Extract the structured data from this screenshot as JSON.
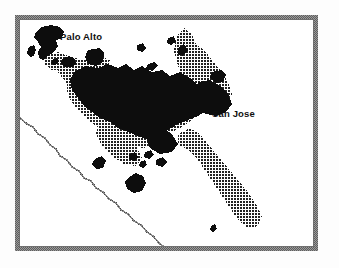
{
  "figure": {
    "kind": "thematic-map",
    "region": "Santa Clara Valley / South San Francisco Bay",
    "width": 339,
    "height": 268
  },
  "colors": {
    "page_background": "#ffffff",
    "map_background": "#fdfdfd",
    "frame": "#8c8c8c",
    "frame_inner_line": "#707070",
    "urban_core": "#0d0d0d",
    "urban_fringe": "#555555",
    "halftone_dot": "#1a1a1a",
    "boundary_line": "#6e6e6e",
    "label_text": "#101010"
  },
  "labels": {
    "palo_alto": "Palo Alto",
    "san_jose": "San Jose"
  },
  "legend_hint": {
    "dark_fill_meaning": "dense urbanized area",
    "dotted_fill_meaning": "urbanized area"
  },
  "features": {
    "frame": {
      "x": 17,
      "y": 17,
      "width": 299,
      "height": 232,
      "stroke_width": 4
    },
    "boundary_line": {
      "name": "county-boundary-line",
      "path": "M 20 118 L 27 124 L 33 127 L 38 134 L 45 138 L 50 145 L 56 149 L 60 156 L 67 160 L 72 167 L 79 171 L 84 178 L 91 181 L 96 188 L 103 192 L 109 199 L 116 203 L 121 210 L 128 214 L 134 221 L 141 225 L 147 232 L 153 236 L 159 243 L 163 246"
    },
    "urban_core_shapes": [
      {
        "name": "palo-alto-blob",
        "path": "M 36 32 L 42 27 L 51 25 L 60 27 L 64 32 L 62 38 L 56 40 L 58 46 L 54 52 L 48 56 L 43 60 L 39 58 L 38 52 L 41 47 L 38 42 L 34 38 Z"
      },
      {
        "name": "palo-alto-sat-a",
        "path": "M 29 47 L 34 45 L 36 50 L 34 56 L 30 57 L 27 53 Z"
      },
      {
        "name": "palo-alto-sat-b",
        "path": "M 52 60 L 57 58 L 59 62 L 55 65 L 51 64 Z"
      },
      {
        "name": "mountain-view-blob",
        "path": "M 62 59 L 69 56 L 74 58 L 76 63 L 72 67 L 65 67 L 61 64 Z"
      },
      {
        "name": "sunnyvale-blob",
        "path": "M 88 50 L 100 48 L 104 53 L 103 62 L 96 66 L 88 64 L 85 57 Z"
      },
      {
        "name": "bay-island-a",
        "path": "M 137 45 L 143 43 L 146 48 L 142 52 L 137 50 Z"
      },
      {
        "name": "bay-island-b",
        "path": "M 147 65 L 154 62 L 158 66 L 152 71 L 146 69 Z"
      },
      {
        "name": "bay-island-c",
        "path": "M 168 38 L 174 36 L 176 42 L 171 45 L 167 43 Z"
      },
      {
        "name": "milpitas-blob",
        "path": "M 212 72 L 221 70 L 226 75 L 223 82 L 215 83 L 210 78 Z"
      },
      {
        "name": "central-core",
        "path": "M 74 72 L 86 66 L 98 68 L 108 64 L 118 68 L 126 64 L 134 70 L 142 66 L 152 72 L 162 70 L 170 76 L 180 72 L 190 78 L 198 86 L 206 92 L 212 100 L 208 110 L 198 116 L 188 120 L 178 124 L 168 130 L 158 136 L 148 140 L 138 136 L 128 132 L 118 128 L 110 122 L 100 118 L 92 112 L 84 106 L 78 98 L 72 90 L 70 80 Z"
      },
      {
        "name": "san-jose-east-lobe",
        "path": "M 198 82 L 210 80 L 220 86 L 228 94 L 232 104 L 226 112 L 216 116 L 206 114 L 198 108 L 194 98 Z"
      },
      {
        "name": "core-arm-south",
        "path": "M 150 130 L 162 128 L 172 134 L 178 144 L 172 152 L 160 154 L 150 148 L 146 138 Z"
      },
      {
        "name": "sat-blob-a",
        "path": "M 95 159 L 102 156 L 106 161 L 103 168 L 96 169 L 92 164 Z"
      },
      {
        "name": "sat-blob-b",
        "path": "M 129 154 L 135 152 L 138 157 L 134 161 L 129 159 Z"
      },
      {
        "name": "sat-blob-c",
        "path": "M 145 152 L 151 150 L 154 155 L 149 159 L 144 157 Z"
      },
      {
        "name": "sat-blob-d",
        "path": "M 156 160 L 163 157 L 167 162 L 162 167 L 156 165 Z"
      },
      {
        "name": "sat-blob-e",
        "path": "M 140 162 L 145 160 L 147 165 L 143 168 L 139 166 Z"
      },
      {
        "name": "morgan-hill-blob",
        "path": "M 129 177 L 136 173 L 143 176 L 146 183 L 142 191 L 134 193 L 127 189 L 125 182 Z"
      },
      {
        "name": "gilroy-dot",
        "path": "M 211 226 L 215 224 L 217 229 L 213 232 L 210 230 Z"
      },
      {
        "name": "bay-sliver-n",
        "path": "M 178 48 L 184 44 L 188 50 L 183 56 L 178 54 Z"
      }
    ],
    "urban_fringe_shapes": [
      {
        "name": "fringe-northwest",
        "path": "M 60 64 L 74 58 L 88 60 L 100 56 L 110 60 L 106 70 L 96 76 L 86 80 L 74 84 L 64 80 L 58 72 Z"
      },
      {
        "name": "fringe-central",
        "path": "M 66 80 L 80 72 L 94 74 L 108 70 L 122 74 L 136 70 L 150 76 L 164 74 L 176 80 L 188 88 L 196 98 L 200 110 L 192 120 L 180 128 L 168 134 L 156 142 L 144 148 L 132 146 L 120 140 L 108 134 L 96 126 L 86 118 L 76 108 L 68 96 Z"
      },
      {
        "name": "fringe-east-hills",
        "path": "M 176 36 L 184 28 L 192 34 L 196 44 L 204 50 L 212 60 L 220 70 L 228 82 L 232 94 L 228 106 L 218 112 L 206 110 L 196 102 L 190 90 L 184 78 L 178 66 L 174 52 Z"
      },
      {
        "name": "fringe-south-valley",
        "path": "M 178 134 L 190 128 L 200 134 L 208 144 L 218 156 L 228 168 L 238 180 L 248 192 L 256 204 L 262 216 L 258 226 L 248 228 L 238 220 L 230 208 L 222 196 L 214 184 L 206 172 L 198 160 L 188 150 L 178 144 Z"
      },
      {
        "name": "fringe-sw-foothills",
        "path": "M 100 122 L 114 128 L 126 136 L 136 146 L 142 158 L 136 166 L 124 164 L 112 156 L 102 146 L 96 134 Z"
      },
      {
        "name": "fringe-nw-tip",
        "path": "M 46 56 L 58 52 L 68 56 L 72 64 L 64 70 L 52 70 L 44 64 Z"
      }
    ]
  }
}
